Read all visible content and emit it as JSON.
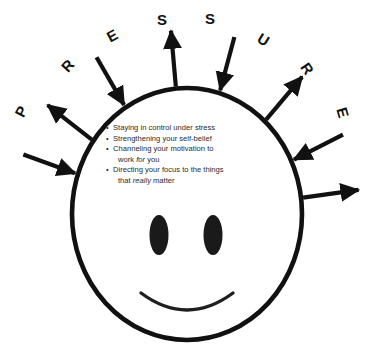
{
  "figure": {
    "title_word": "PRESSURE",
    "face": {
      "name": "smiley-face",
      "outline_color": "#111111",
      "fill_color": "#ffffff",
      "eye_color": "#1a1a1a",
      "mouth": "smile"
    },
    "bullets": [
      {
        "marker": "•",
        "lines": [
          {
            "segments": [
              {
                "text": "Staying in control under stress",
                "italic": false
              }
            ]
          }
        ]
      },
      {
        "marker": "•",
        "lines": [
          {
            "segments": [
              {
                "text": "Strengthening your self-belief",
                "italic": false
              }
            ]
          }
        ]
      },
      {
        "marker": "•",
        "lines": [
          {
            "segments": [
              {
                "text": "Channeling your motivation to",
                "italic": false
              }
            ]
          },
          {
            "segments": [
              {
                "text": "work ",
                "italic": false
              },
              {
                "text": "for",
                "italic": true
              },
              {
                "text": " you",
                "italic": false
              }
            ]
          }
        ]
      },
      {
        "marker": "•",
        "lines": [
          {
            "segments": [
              {
                "text": "Directing your focus to the things",
                "italic": false
              }
            ]
          },
          {
            "segments": [
              {
                "text": "that ",
                "italic": false
              },
              {
                "text": "really",
                "italic": true
              },
              {
                "text": " matter",
                "italic": false
              }
            ]
          }
        ]
      }
    ],
    "arrows": [
      {
        "letter": "P",
        "direction": "inward",
        "angle_deg": 200,
        "letter_x": 16,
        "letter_y": 104,
        "letter_rot": -62
      },
      {
        "letter": "R",
        "direction": "outward",
        "angle_deg": 218,
        "letter_x": 62,
        "letter_y": 58,
        "letter_rot": -48
      },
      {
        "letter": "E",
        "direction": "inward",
        "angle_deg": 240,
        "letter_x": 107,
        "letter_y": 28,
        "letter_rot": -28
      },
      {
        "letter": "S",
        "direction": "outward",
        "angle_deg": 265,
        "letter_x": 157,
        "letter_y": 12,
        "letter_rot": 0
      },
      {
        "letter": "S",
        "direction": "inward",
        "angle_deg": 285,
        "letter_x": 205,
        "letter_y": 11,
        "letter_rot": 0
      },
      {
        "letter": "U",
        "direction": "outward",
        "angle_deg": 310,
        "letter_x": 258,
        "letter_y": 32,
        "letter_rot": 32
      },
      {
        "letter": "R",
        "direction": "inward",
        "angle_deg": 333,
        "letter_x": 302,
        "letter_y": 61,
        "letter_rot": 55
      },
      {
        "letter": "E",
        "direction": "outward",
        "angle_deg": 352,
        "letter_x": 338,
        "letter_y": 105,
        "letter_rot": 74
      }
    ],
    "geometry": {
      "center_x": 187,
      "center_y": 214,
      "radius": 115
    }
  }
}
